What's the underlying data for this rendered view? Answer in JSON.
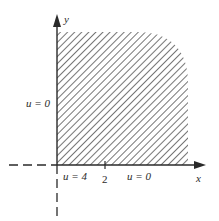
{
  "figure": {
    "axes": {
      "x_label": "x",
      "y_label": "y"
    },
    "boundary_labels": {
      "left_edge": "u = 0",
      "bottom_near_origin": "u = 4",
      "bottom_far": "u = 0"
    },
    "ticks": {
      "x_tick_label": "2"
    },
    "region": {
      "description": "shaded first-quadrant region (hatched)",
      "hatch_color": "#3a3a3a"
    },
    "colors": {
      "ink": "#2a2a2a",
      "background": "#ffffff"
    }
  }
}
